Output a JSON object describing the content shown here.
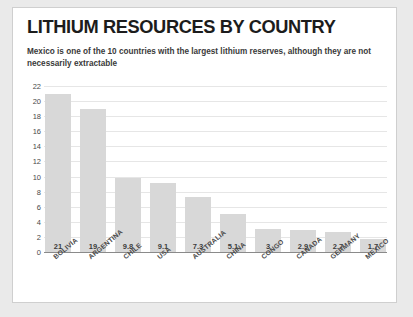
{
  "card": {
    "title": "LITHIUM RESOURCES BY COUNTRY",
    "subtitle": "Mexico is one of the 10 countries with the largest lithium reserves, although they are not necessarily extractable"
  },
  "colors": {
    "bar": "#d8d8d8",
    "card_background": "#ffffff",
    "page_background": "#eaeaea",
    "gridline": "#e6e6e6",
    "axis": "#8a8a8a",
    "title_text": "#1c1c1c",
    "label_text": "#4a4a4a"
  },
  "chart_data": {
    "type": "bar",
    "title": "LITHIUM RESOURCES BY COUNTRY",
    "subtitle": "Mexico is one of the 10 countries with the largest lithium reserves, although they are not necessarily extractable",
    "categories": [
      "BOLIVIA",
      "ARGENTINA",
      "CHILE",
      "USA",
      "AUSTRALIA",
      "CHINA",
      "CONGO",
      "CANADA",
      "GERMANY",
      "MEXICO"
    ],
    "values": [
      21,
      19,
      9.8,
      9.1,
      7.3,
      5.1,
      3,
      2.9,
      2.7,
      1.7
    ],
    "value_labels": [
      "21",
      "19",
      "9.8",
      "9.1",
      "7.3",
      "5.1",
      "3",
      "2.9",
      "2.7",
      "1.7"
    ],
    "xlabel": "",
    "ylabel": "",
    "ylim": [
      0,
      22
    ],
    "ytick_step": 2,
    "yticks": [
      22,
      20,
      18,
      16,
      14,
      12,
      10,
      8,
      6,
      4,
      2,
      0
    ],
    "ytick_labels": [
      "22",
      "20",
      "18",
      "16",
      "14",
      "12",
      "10",
      "8",
      "6",
      "4",
      "2",
      "0"
    ],
    "grid": "horizontal",
    "legend": "none",
    "value_label_position": "inside-bottom",
    "category_label_rotation": -40
  }
}
